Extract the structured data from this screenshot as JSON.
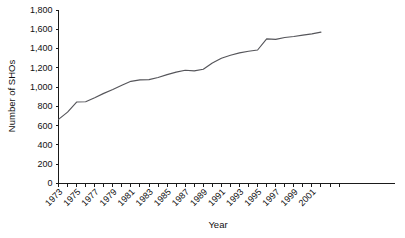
{
  "chart_data": {
    "type": "line",
    "title": "",
    "xlabel": "Year",
    "ylabel": "Number of SHOs",
    "grid": false,
    "legend": "none",
    "xlim": [
      1973,
      2004
    ],
    "ylim": [
      0,
      1800
    ],
    "ytick_labels": [
      "1,800",
      "1,600",
      "1,400",
      "1,200",
      "1,000",
      "800",
      "600",
      "400",
      "200",
      "0"
    ],
    "ytick_values": [
      1800,
      1600,
      1400,
      1200,
      1000,
      800,
      600,
      400,
      200,
      0
    ],
    "xtick_labels": [
      "1973",
      "1975",
      "1977",
      "1979",
      "1981",
      "1983",
      "1985",
      "1987",
      "1989",
      "1991",
      "1993",
      "1995",
      "1997",
      "1999",
      "2001"
    ],
    "xtick_values": [
      1973,
      1975,
      1977,
      1979,
      1981,
      1983,
      1985,
      1987,
      1989,
      1991,
      1993,
      1995,
      1997,
      1999,
      2001
    ],
    "x": [
      1973,
      1974,
      1975,
      1976,
      1977,
      1978,
      1979,
      1980,
      1981,
      1982,
      1983,
      1984,
      1985,
      1986,
      1987,
      1988,
      1989,
      1990,
      1991,
      1992,
      1993,
      1994,
      1995,
      1996,
      1997,
      1998,
      1999,
      2000,
      2001,
      2002
    ],
    "series": [
      {
        "name": "Number of SHOs",
        "color": "#55555a",
        "values": [
          665,
          740,
          845,
          848,
          890,
          935,
          975,
          1020,
          1060,
          1075,
          1078,
          1100,
          1130,
          1155,
          1175,
          1168,
          1185,
          1250,
          1300,
          1330,
          1355,
          1372,
          1385,
          1500,
          1495,
          1515,
          1525,
          1540,
          1552,
          1570
        ]
      }
    ]
  }
}
